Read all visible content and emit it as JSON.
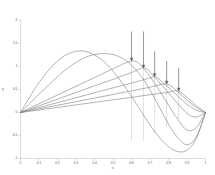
{
  "chart_data": {
    "type": "line",
    "title": "",
    "xlabel": "x",
    "ylabel": "y",
    "xlim": [
      0,
      1
    ],
    "ylim": [
      -1,
      2
    ],
    "grid": false,
    "legend": false,
    "background": "#ffffff",
    "axis_color": "#c8c8c8",
    "line_color": "#808080",
    "accent_color": "#606060",
    "xticks": [
      0,
      0.1,
      0.2,
      0.3,
      0.4,
      0.5,
      0.6,
      0.7,
      0.8,
      0.9,
      1
    ],
    "xticklabels": [
      "0",
      "0.1",
      "0.2",
      "0.3",
      "0.4",
      "0.5",
      "0.6",
      "0.7",
      "0.8",
      "0.9",
      "1"
    ],
    "yticks": [
      -1,
      -0.5,
      0,
      0.5,
      1,
      1.5,
      2
    ],
    "yticklabels": [
      "-1",
      "-0.5",
      "0",
      "0.5",
      "1",
      "1.5",
      "2"
    ],
    "series": [
      {
        "name": "curve-1",
        "comment": "tallest arch, peak near x=0.35, y=1.33",
        "points_x": [
          0,
          0.05,
          0.1,
          0.15,
          0.2,
          0.25,
          0.3,
          0.35,
          0.4,
          0.45,
          0.5,
          0.55,
          0.6,
          0.65,
          0.7,
          0.75,
          0.8,
          0.85,
          0.9,
          0.95,
          1
        ],
        "points_y": [
          0,
          0.34,
          0.65,
          0.91,
          1.12,
          1.26,
          1.33,
          1.33,
          1.25,
          1.11,
          0.9,
          0.64,
          0.35,
          0.04,
          -0.27,
          -0.54,
          -0.74,
          -0.85,
          -0.82,
          -0.57,
          0
        ]
      },
      {
        "name": "curve-2",
        "comment": "broad arch, peak near x=0.5, y=1.28",
        "points_x": [
          0,
          0.05,
          0.1,
          0.15,
          0.2,
          0.25,
          0.3,
          0.35,
          0.4,
          0.45,
          0.5,
          0.55,
          0.6,
          0.65,
          0.7,
          0.75,
          0.8,
          0.85,
          0.9,
          0.95,
          1
        ],
        "points_y": [
          0,
          0.2,
          0.4,
          0.59,
          0.78,
          0.95,
          1.09,
          1.2,
          1.26,
          1.28,
          1.26,
          1.18,
          1.03,
          0.8,
          0.49,
          0.12,
          -0.25,
          -0.55,
          -0.7,
          -0.53,
          0
        ]
      },
      {
        "name": "curve-3",
        "comment": "rising ray peaking near x=0.6, y=1.12",
        "points_x": [
          0,
          0.1,
          0.2,
          0.3,
          0.4,
          0.5,
          0.6,
          0.65,
          0.7,
          0.75,
          0.8,
          0.85,
          0.9,
          0.95,
          1
        ],
        "points_y": [
          0,
          0.19,
          0.38,
          0.57,
          0.76,
          0.95,
          1.12,
          1.03,
          0.78,
          0.48,
          0.16,
          -0.15,
          -0.38,
          -0.33,
          0
        ]
      },
      {
        "name": "curve-4",
        "comment": "ray peaking near x=0.67, y=0.97",
        "points_x": [
          0,
          0.1,
          0.2,
          0.3,
          0.4,
          0.5,
          0.6,
          0.67,
          0.72,
          0.78,
          0.84,
          0.9,
          0.95,
          1
        ],
        "points_y": [
          0,
          0.145,
          0.29,
          0.435,
          0.58,
          0.72,
          0.87,
          0.97,
          0.79,
          0.52,
          0.24,
          -0.02,
          -0.1,
          0
        ]
      },
      {
        "name": "curve-5",
        "comment": "ray peaking near x=0.73, y=0.78",
        "points_x": [
          0,
          0.1,
          0.2,
          0.3,
          0.4,
          0.5,
          0.6,
          0.7,
          0.73,
          0.79,
          0.85,
          0.9,
          0.95,
          1
        ],
        "points_y": [
          0,
          0.107,
          0.214,
          0.32,
          0.43,
          0.535,
          0.64,
          0.75,
          0.78,
          0.58,
          0.36,
          0.18,
          0.05,
          0
        ]
      },
      {
        "name": "curve-6",
        "comment": "ray peaking near x=0.79, y=0.62",
        "points_x": [
          0,
          0.1,
          0.2,
          0.3,
          0.4,
          0.5,
          0.6,
          0.7,
          0.79,
          0.85,
          0.9,
          0.95,
          1
        ],
        "points_y": [
          0,
          0.078,
          0.157,
          0.235,
          0.314,
          0.392,
          0.47,
          0.55,
          0.62,
          0.45,
          0.27,
          0.11,
          0
        ]
      },
      {
        "name": "curve-7",
        "comment": "lowest ray peaking near x=0.85, y=0.47",
        "points_x": [
          0,
          0.1,
          0.2,
          0.3,
          0.4,
          0.5,
          0.6,
          0.7,
          0.8,
          0.85,
          0.9,
          0.95,
          1
        ],
        "points_y": [
          0,
          0.055,
          0.11,
          0.166,
          0.22,
          0.276,
          0.33,
          0.387,
          0.44,
          0.47,
          0.33,
          0.15,
          0
        ]
      }
    ],
    "annotations": [
      {
        "name": "arrow-1",
        "x": 0.6,
        "y_top": 1.76,
        "y_tip": 1.12,
        "direction": "down"
      },
      {
        "name": "arrow-2",
        "x": 0.665,
        "y_top": 1.76,
        "y_tip": 0.97,
        "direction": "down"
      },
      {
        "name": "arrow-3",
        "x": 0.725,
        "y_top": 1.33,
        "y_tip": 0.78,
        "direction": "down"
      },
      {
        "name": "arrow-4",
        "x": 0.79,
        "y_top": 1.12,
        "y_tip": 0.62,
        "direction": "down"
      },
      {
        "name": "arrow-5",
        "x": 0.855,
        "y_top": 0.97,
        "y_tip": 0.47,
        "direction": "down"
      },
      {
        "name": "droplinе-1",
        "x": 0.6,
        "y_top": 1.12,
        "y_bottom": -0.62
      },
      {
        "name": "dropline-2",
        "x": 0.665,
        "y_top": 0.97,
        "y_bottom": -0.62
      },
      {
        "name": "dropline-3",
        "x": 0.725,
        "y_top": 0.78,
        "y_bottom": -0.45
      },
      {
        "name": "dropline-4",
        "x": 0.79,
        "y_top": 0.62,
        "y_bottom": -0.3
      },
      {
        "name": "dropline-5",
        "x": 0.855,
        "y_top": 0.47,
        "y_bottom": -0.15
      }
    ]
  }
}
